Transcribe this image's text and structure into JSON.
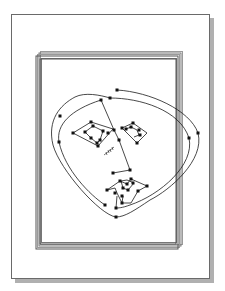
{
  "illustration": {
    "subject": "Face drawn from node-connected paths on a stack of framed pages",
    "colors": {
      "ink": "#1a1a1a",
      "frame": "#555555",
      "frame_light": "#9a9a9a",
      "shadow": "#a8a8a8",
      "paper": "#ffffff"
    }
  }
}
